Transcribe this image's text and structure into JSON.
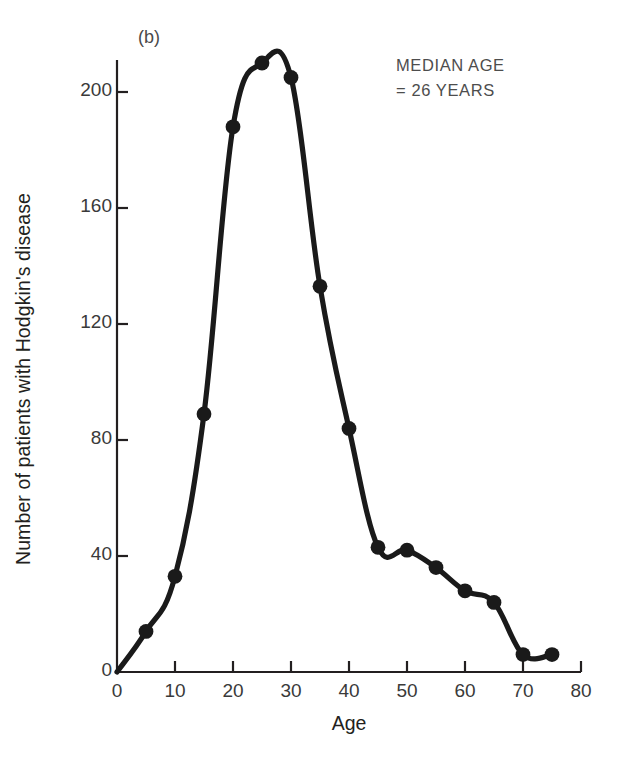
{
  "figure": {
    "panel_label": "(b)",
    "annotation_line1": "MEDIAN AGE",
    "annotation_line2": "= 26 YEARS"
  },
  "chart_data": {
    "type": "line",
    "title": "",
    "panel": "(b)",
    "xlabel": "Age",
    "ylabel": "Number of patients with Hodgkin's disease",
    "xlim": [
      0,
      80
    ],
    "ylim": [
      0,
      215
    ],
    "xticks": [
      0,
      10,
      20,
      30,
      40,
      50,
      60,
      70,
      80
    ],
    "xtick_labels": [
      "0",
      "10",
      "20",
      "30",
      "40",
      "50",
      "60",
      "70",
      "80"
    ],
    "yticks": [
      0,
      40,
      80,
      120,
      160,
      200
    ],
    "ytick_labels": [
      "0",
      "40",
      "80",
      "120",
      "160",
      "200"
    ],
    "grid": false,
    "legend": null,
    "marker": "filled-circle",
    "line_color": "#1a1a1a",
    "marker_color": "#1a1a1a",
    "x": [
      0,
      5,
      10,
      15,
      20,
      25,
      30,
      35,
      40,
      45,
      50,
      55,
      60,
      65,
      70,
      75
    ],
    "values": [
      0,
      14,
      33,
      89,
      188,
      210,
      205,
      133,
      84,
      43,
      42,
      36,
      28,
      24,
      6,
      6
    ],
    "points": [
      {
        "age": 0,
        "count": 0,
        "marker": false
      },
      {
        "age": 5,
        "count": 14,
        "marker": true
      },
      {
        "age": 10,
        "count": 33,
        "marker": true
      },
      {
        "age": 15,
        "count": 89,
        "marker": true
      },
      {
        "age": 20,
        "count": 188,
        "marker": true
      },
      {
        "age": 25,
        "count": 210,
        "marker": true
      },
      {
        "age": 30,
        "count": 205,
        "marker": true
      },
      {
        "age": 35,
        "count": 133,
        "marker": true
      },
      {
        "age": 40,
        "count": 84,
        "marker": true
      },
      {
        "age": 45,
        "count": 43,
        "marker": true
      },
      {
        "age": 50,
        "count": 42,
        "marker": true
      },
      {
        "age": 55,
        "count": 36,
        "marker": true
      },
      {
        "age": 60,
        "count": 28,
        "marker": true
      },
      {
        "age": 65,
        "count": 24,
        "marker": true
      },
      {
        "age": 70,
        "count": 6,
        "marker": true
      },
      {
        "age": 75,
        "count": 6,
        "marker": true
      }
    ],
    "annotations": [
      {
        "text": "MEDIAN AGE",
        "x": 55,
        "y": 205
      },
      {
        "text": "= 26 YEARS",
        "x": 55,
        "y": 196
      }
    ],
    "median_age": 26
  }
}
